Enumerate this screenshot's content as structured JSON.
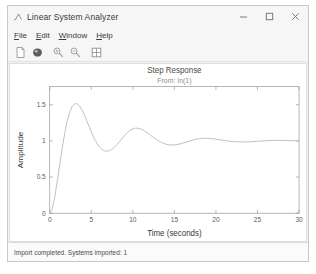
{
  "window": {
    "title": "Linear System Analyzer",
    "app_icon": "matlab-icon",
    "controls": [
      {
        "name": "minimize-button",
        "glyph": "minimize-icon"
      },
      {
        "name": "maximize-button",
        "glyph": "maximize-icon"
      },
      {
        "name": "close-button",
        "glyph": "close-icon"
      }
    ]
  },
  "menubar": {
    "items": [
      {
        "label": "File",
        "accel": "F"
      },
      {
        "label": "Edit",
        "accel": "E"
      },
      {
        "label": "Window",
        "accel": "W"
      },
      {
        "label": "Help",
        "accel": "H"
      }
    ]
  },
  "toolbar": {
    "buttons": [
      {
        "name": "new-document-button",
        "icon": "new-document-icon"
      },
      {
        "name": "print-button",
        "icon": "print-icon"
      },
      {
        "name": "zoom-in-button",
        "icon": "magnifier-plus-icon"
      },
      {
        "name": "zoom-out-button",
        "icon": "magnifier-minus-icon"
      },
      {
        "name": "grid-layout-button",
        "icon": "grid-layout-icon"
      }
    ]
  },
  "statusbar": {
    "message": "Import completed. Systems imported: 1"
  },
  "colors": {
    "window_bg": "#f4f4f4",
    "panel_bg": "#ffffff",
    "axis": "#9a9a9a",
    "curve": "#b7b7b7",
    "text": "#3a3a3a",
    "grid": "#e8e8e8"
  },
  "chart_data": {
    "type": "line",
    "title": "Step Response",
    "subtitle": "From: In(1)",
    "xlabel": "Time (seconds)",
    "ylabel": "Amplitude",
    "xlim": [
      0,
      30
    ],
    "ylim": [
      0,
      1.75
    ],
    "xticks": [
      0,
      5,
      10,
      15,
      20,
      25,
      30
    ],
    "xtick_labels": [
      "0",
      "5",
      "10",
      "15",
      "20",
      "25",
      "30"
    ],
    "yticks": [
      0,
      0.5,
      1,
      1.5
    ],
    "ytick_labels": [
      "0",
      "0.5",
      "1",
      "1.5"
    ],
    "grid": false,
    "legend": null,
    "series": [
      {
        "name": "Step Response",
        "color": "#b7b7b7",
        "x": [
          0,
          0.3,
          0.6,
          0.9,
          1.2,
          1.5,
          1.8,
          2.1,
          2.4,
          2.7,
          3.0,
          3.3,
          3.6,
          3.9,
          4.2,
          4.5,
          4.8,
          5.1,
          5.4,
          5.7,
          6.0,
          6.3,
          6.6,
          6.9,
          7.2,
          7.5,
          7.8,
          8.1,
          8.4,
          8.7,
          9.0,
          9.3,
          9.6,
          9.9,
          10.2,
          10.5,
          10.8,
          11.1,
          11.4,
          11.7,
          12.0,
          12.5,
          13.0,
          13.5,
          14.0,
          14.5,
          15.0,
          15.5,
          16.0,
          16.5,
          17.0,
          17.5,
          18.0,
          18.5,
          19.0,
          19.5,
          20.0,
          21.0,
          22.0,
          23.0,
          24.0,
          25.0,
          26.0,
          27.0,
          28.0,
          29.0,
          30.0
        ],
        "y": [
          0.0,
          0.062,
          0.222,
          0.436,
          0.671,
          0.9,
          1.104,
          1.272,
          1.396,
          1.476,
          1.513,
          1.513,
          1.481,
          1.424,
          1.35,
          1.266,
          1.18,
          1.098,
          1.024,
          0.962,
          0.913,
          0.88,
          0.861,
          0.857,
          0.866,
          0.886,
          0.915,
          0.951,
          0.991,
          1.033,
          1.073,
          1.11,
          1.14,
          1.162,
          1.174,
          1.177,
          1.171,
          1.158,
          1.138,
          1.115,
          1.089,
          1.046,
          1.006,
          0.974,
          0.953,
          0.943,
          0.944,
          0.953,
          0.968,
          0.986,
          1.004,
          1.019,
          1.03,
          1.035,
          1.035,
          1.031,
          1.024,
          1.006,
          0.991,
          0.985,
          0.987,
          0.995,
          1.003,
          1.007,
          1.007,
          1.004,
          1.0
        ]
      }
    ]
  }
}
